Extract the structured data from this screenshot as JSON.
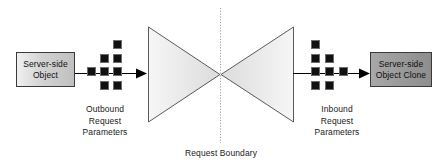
{
  "diagram": {
    "boundary_label": "Request Boundary",
    "nodes": {
      "source": {
        "label": "Server-side\nObject",
        "name": "server-side-object"
      },
      "target": {
        "label": "Server-side\nObject Clone",
        "name": "server-side-object-clone"
      }
    },
    "captions": {
      "outbound": "Outbound\nRequest\nParameters",
      "inbound": "Inbound\nRequest\nParameters"
    },
    "colors": {
      "source_box_fill_light": "#f0f0f0",
      "source_box_fill_dark": "#c0c0c0",
      "target_box_fill_light": "#a8a8a8",
      "target_box_fill_dark": "#8e8e8e",
      "box_border": "#3a3a3a",
      "square_fill": "#111111",
      "triangle_fill_light": "#f4f4f4",
      "triangle_fill_dark": "#dcdcdc",
      "triangle_stroke": "#555555",
      "boundary_line": "#9a9a9a",
      "arrow": "#000000",
      "text": "#1a1a1a",
      "background": "#ffffff"
    },
    "geometry": {
      "boundary_x": 220,
      "center_y": 74,
      "left_triangle": {
        "x1": 148,
        "y1": 27,
        "x2": 148,
        "y2": 122,
        "apex_x": 220,
        "apex_y": 74
      },
      "right_triangle": {
        "x1": 293,
        "y1": 27,
        "x2": 293,
        "y2": 122,
        "apex_x": 220,
        "apex_y": 74
      },
      "left_arrow": {
        "x_start": 75,
        "x_end": 147,
        "y": 73
      },
      "right_arrow": {
        "x_start": 293,
        "x_end": 369,
        "y": 73
      }
    },
    "outbound_squares": [
      {
        "x": 113,
        "y": 40
      },
      {
        "x": 100,
        "y": 54
      },
      {
        "x": 113,
        "y": 54
      },
      {
        "x": 87,
        "y": 67
      },
      {
        "x": 100,
        "y": 67
      },
      {
        "x": 113,
        "y": 67
      },
      {
        "x": 100,
        "y": 81
      },
      {
        "x": 113,
        "y": 81
      }
    ],
    "inbound_squares": [
      {
        "x": 311,
        "y": 40
      },
      {
        "x": 311,
        "y": 54
      },
      {
        "x": 325,
        "y": 54
      },
      {
        "x": 311,
        "y": 67
      },
      {
        "x": 325,
        "y": 67
      },
      {
        "x": 339,
        "y": 67
      },
      {
        "x": 311,
        "y": 81
      },
      {
        "x": 325,
        "y": 81
      }
    ]
  }
}
